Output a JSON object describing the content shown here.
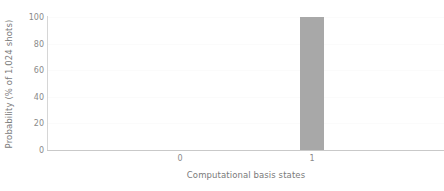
{
  "chart_data": {
    "type": "bar",
    "title": "",
    "subtitle": "",
    "xlabel": "Computational basis states",
    "ylabel": "Probability (% of 1,024 shots)",
    "categories": [
      "0",
      "1"
    ],
    "values": [
      0,
      100
    ],
    "series": [
      {
        "name": "Probability",
        "values": [
          0,
          100
        ]
      }
    ],
    "ylim": [
      0,
      100
    ],
    "yticks": [
      0,
      20,
      40,
      60,
      80,
      100
    ],
    "ytick_labels": [
      "0",
      "20",
      "40",
      "60",
      "80",
      "100"
    ],
    "xticks": [
      "0",
      "1"
    ],
    "grid": true,
    "grid_axis": "y",
    "legend": false,
    "legend_position": "none",
    "bar_color": "#a8a8a8",
    "background_color": "#ffffff",
    "axis_color": "#c9c9c9",
    "tick_label_color": "#8a8a8a",
    "axis_label_color": "#7a7a7a"
  }
}
